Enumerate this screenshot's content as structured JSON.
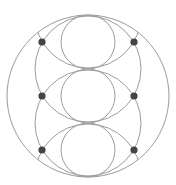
{
  "diagram": {
    "width": 176,
    "height": 185,
    "stroke_color": "#9a9a9a",
    "dot_color": "#444444",
    "outer_circle": {
      "cx": 88,
      "cy": 96,
      "r": 81
    },
    "inner_circles": [
      {
        "cx": 88,
        "cy": 42,
        "r": 27
      },
      {
        "cx": 88,
        "cy": 96,
        "r": 27
      },
      {
        "cx": 88,
        "cy": 150,
        "r": 27
      }
    ],
    "arc_circles": [
      {
        "cx": 88,
        "cy": 15,
        "r": 53
      },
      {
        "cx": 88,
        "cy": 69,
        "r": 53
      },
      {
        "cx": 88,
        "cy": 123,
        "r": 53
      },
      {
        "cx": 88,
        "cy": 177,
        "r": 53
      }
    ],
    "dots": [
      {
        "cx": 42,
        "cy": 42,
        "r": 3.6
      },
      {
        "cx": 134,
        "cy": 42,
        "r": 3.6
      },
      {
        "cx": 42,
        "cy": 96,
        "r": 3.6
      },
      {
        "cx": 134,
        "cy": 96,
        "r": 3.6
      },
      {
        "cx": 42,
        "cy": 150,
        "r": 3.6
      },
      {
        "cx": 134,
        "cy": 150,
        "r": 3.6
      }
    ]
  }
}
